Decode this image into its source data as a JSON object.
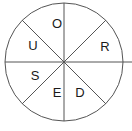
{
  "figure": {
    "type": "pie-wheel-diagram",
    "title": "",
    "shape": "circle",
    "sector_count": 8,
    "divider_count": 4,
    "stroke_color": "#555555",
    "fill_color": "#ffffff",
    "text_color": "#1a1a1a",
    "background_color": "#ffffff"
  },
  "geometry": {
    "center_x": 64,
    "center_y": 62,
    "radius": 59
  },
  "chart_data": {
    "type": "pie",
    "title": "",
    "categories": [
      "sector-1",
      "sector-2",
      "sector-3",
      "sector-4",
      "sector-5",
      "sector-6",
      "sector-7",
      "sector-8"
    ],
    "values": [
      12.5,
      12.5,
      12.5,
      12.5,
      12.5,
      12.5,
      12.5,
      12.5
    ],
    "labels": [
      "O",
      "",
      "R",
      "D",
      "E",
      "S",
      "U",
      ""
    ],
    "xlabel": "",
    "ylabel": "",
    "legend": "none",
    "grid": false
  },
  "sectors": [
    {
      "id": "sector-top-left-of-vertical",
      "label": "O",
      "label_x": 57,
      "label_y": 25
    },
    {
      "id": "sector-top-right-of-vertical",
      "label": "",
      "label_x": 88,
      "label_y": 25
    },
    {
      "id": "sector-right-upper",
      "label": "R",
      "label_x": 105,
      "label_y": 48
    },
    {
      "id": "sector-right-lower",
      "label": "D",
      "label_x": 80,
      "label_y": 94
    },
    {
      "id": "sector-bottom-right-of-vertical",
      "label": "E",
      "label_x": 57,
      "label_y": 94
    },
    {
      "id": "sector-bottom-left-of-vertical",
      "label": "S",
      "label_x": 35,
      "label_y": 77
    },
    {
      "id": "sector-left-lower",
      "label": "U",
      "label_x": 33,
      "label_y": 47
    },
    {
      "id": "sector-left-upper",
      "label": "",
      "label_x": 20,
      "label_y": 80
    }
  ],
  "dividers": [
    {
      "id": "divider-vertical",
      "x1": 64,
      "y1": 3,
      "x2": 64,
      "y2": 121
    },
    {
      "id": "divider-horizontal",
      "x1": 5,
      "y1": 62,
      "x2": 132,
      "y2": 62
    },
    {
      "id": "divider-diagonal-nw-se",
      "x1": 22,
      "y1": 20,
      "x2": 106,
      "y2": 104
    },
    {
      "id": "divider-diagonal-ne-sw",
      "x1": 106,
      "y1": 20,
      "x2": 22,
      "y2": 104
    }
  ]
}
